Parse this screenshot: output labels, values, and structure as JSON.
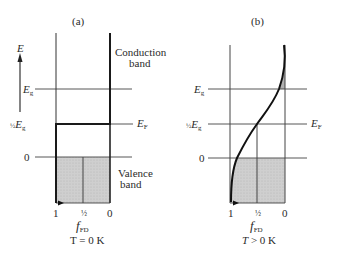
{
  "panels": {
    "a": {
      "label": "(a)",
      "axis_label": "E",
      "conduction_band_line1": "Conduction",
      "conduction_band_line2": "band",
      "valence_band_line1": "Valence",
      "valence_band_line2": "band",
      "level_eg": "E",
      "level_eg_sub": "g",
      "level_half_prefix": "½",
      "level_half": "E",
      "level_half_sub": "g",
      "level_zero": "0",
      "fermi": "E",
      "fermi_sub": "F",
      "tick_1": "1",
      "tick_half": "½",
      "tick_0": "0",
      "x_label": "f",
      "x_label_sub": "FD",
      "temperature": "T = 0 K"
    },
    "b": {
      "label": "(b)",
      "level_eg": "E",
      "level_eg_sub": "g",
      "level_half_prefix": "½",
      "level_half": "E",
      "level_half_sub": "g",
      "level_zero": "0",
      "fermi": "E",
      "fermi_sub": "F",
      "tick_1": "1",
      "tick_half": "½",
      "tick_0": "0",
      "x_label": "f",
      "x_label_sub": "FD",
      "temperature_T": "T",
      "temperature_rest": " > 0 K"
    }
  },
  "colors": {
    "line": "#333333",
    "shade": "#c8c8c8"
  }
}
